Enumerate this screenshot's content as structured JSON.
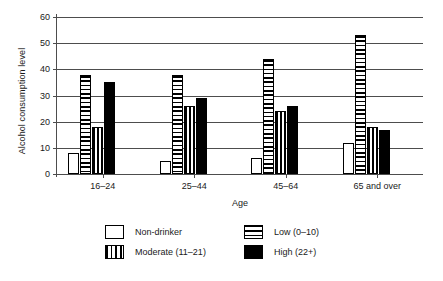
{
  "chart_data": {
    "type": "bar",
    "title": "",
    "subtitle": "",
    "xlabel": "Age",
    "ylabel": "Alcohol consumption level",
    "categories": [
      "16–24",
      "25–44",
      "45–64",
      "65 and over"
    ],
    "series": [
      {
        "name": "Non-drinker",
        "values": [
          8,
          5,
          6,
          12
        ],
        "pattern": "empty",
        "color": "#ffffff"
      },
      {
        "name": "Low (0–10)",
        "values": [
          38,
          38,
          44,
          53
        ],
        "pattern": "horizontal-stripes",
        "color": "#000000"
      },
      {
        "name": "Moderate (11–21)",
        "values": [
          18,
          26,
          24,
          18
        ],
        "pattern": "vertical-stripes",
        "color": "#000000"
      },
      {
        "name": "High (22+)",
        "values": [
          35,
          29,
          26,
          17
        ],
        "pattern": "solid",
        "color": "#000000"
      }
    ],
    "ylim": [
      0,
      60
    ],
    "yticks": [
      0,
      10,
      20,
      30,
      40,
      50,
      60
    ],
    "ytick_labels": [
      "0",
      "10",
      "20",
      "30",
      "40",
      "50",
      "60"
    ],
    "grid": true,
    "grid_axis": "y",
    "legend_position": "bottom",
    "legend_columns": 2,
    "axis_color": "#4d4d4d",
    "background": "#ffffff"
  },
  "legend": {
    "entries": [
      {
        "label": "Non-drinker",
        "swatch": "empty-swatch"
      },
      {
        "label": "Low (0–10)",
        "swatch": "horizontal-stripes-swatch"
      },
      {
        "label": "Moderate (11–21)",
        "swatch": "vertical-stripes-swatch"
      },
      {
        "label": "High (22+)",
        "swatch": "solid-black-swatch"
      }
    ]
  }
}
